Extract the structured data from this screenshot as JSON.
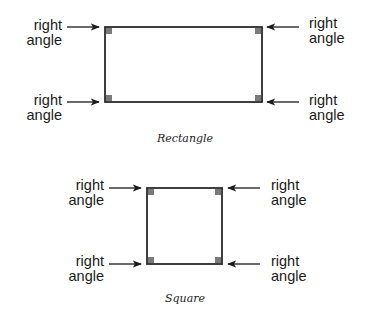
{
  "figures": {
    "rectangle": {
      "caption": "Rectangle",
      "labels": {
        "top_left": "right\nangle",
        "top_right": "right\nangle",
        "bottom_left": "right\nangle",
        "bottom_right": "right\nangle"
      }
    },
    "square": {
      "caption": "Square",
      "labels": {
        "top_left": "right\nangle",
        "top_right": "right\nangle",
        "bottom_left": "right\nangle",
        "bottom_right": "right\nangle"
      }
    }
  },
  "colors": {
    "line": "#2a2a2a",
    "corner_marker": "#7a7a7a",
    "text": "#1a1a1a"
  }
}
